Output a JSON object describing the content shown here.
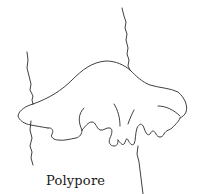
{
  "figure": {
    "caption": "Polypore",
    "style": "black line drawing on white",
    "colors": {
      "background": "#ffffff",
      "line": "#2a2a2a",
      "text": "#1a1a1a"
    }
  }
}
